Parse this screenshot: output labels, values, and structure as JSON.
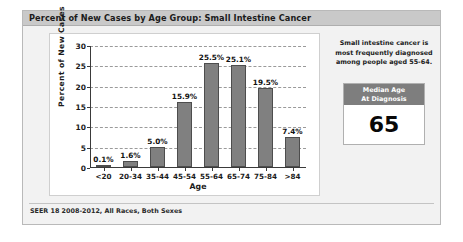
{
  "panel": {
    "title": "Percent of New Cases by Age Group: Small Intestine Cancer",
    "footer": "SEER 18 2008-2012, All Races, Both Sexes"
  },
  "side": {
    "note": "Small intestine cancer is most frequently diagnosed among people aged 55-64.",
    "median_box": {
      "header_line1": "Median Age",
      "header_line2": "At Diagnosis",
      "value": "65"
    }
  },
  "colors": {
    "bar_fill": "#808080",
    "bar_border": "#4d4d4d",
    "titlebar": "#c9c9c9",
    "panel_bg": "#f2f2f2",
    "median_header": "#7e7e7e"
  },
  "chart_data": {
    "type": "bar",
    "title": "Percent of New Cases by Age Group: Small Intestine Cancer",
    "xlabel": "Age",
    "ylabel": "Percent of New Cases",
    "categories": [
      "<20",
      "20-34",
      "35-44",
      "45-54",
      "55-64",
      "65-74",
      "75-84",
      ">84"
    ],
    "values": [
      0.1,
      1.6,
      5.0,
      15.9,
      25.5,
      25.1,
      19.5,
      7.4
    ],
    "data_labels": [
      "0.1%",
      "1.6%",
      "5.0%",
      "15.9%",
      "25.5%",
      "25.1%",
      "19.5%",
      "7.4%"
    ],
    "ylim": [
      0,
      30
    ],
    "yticks": [
      0,
      5,
      10,
      15,
      20,
      25,
      30
    ],
    "ytick_labels": [
      "0",
      "5",
      "10",
      "15",
      "20",
      "25",
      "30"
    ],
    "grid": true,
    "legend": false,
    "source": "SEER 18 2008-2012, All Races, Both Sexes"
  }
}
